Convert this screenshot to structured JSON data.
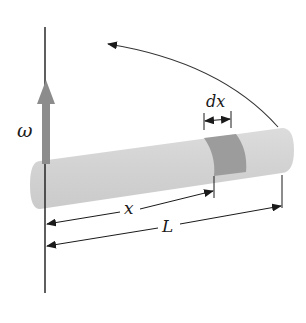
{
  "diagram": {
    "labels": {
      "omega": "ω",
      "dx": "dx",
      "x": "x",
      "L": "L"
    },
    "colors": {
      "rod": "#d4d4d4",
      "element": "#9a9a9a",
      "omega_arrow": "#8c8c8c",
      "lines": "#1a1a1a"
    }
  }
}
